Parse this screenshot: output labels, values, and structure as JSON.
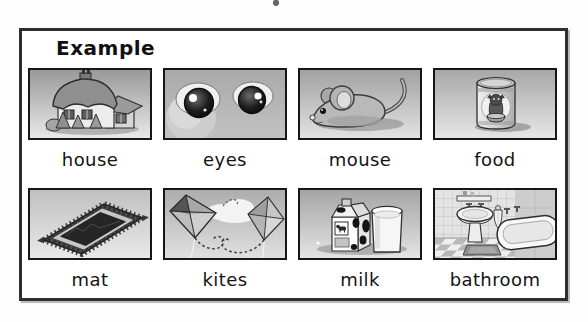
{
  "worksheet": {
    "title": "Example",
    "tiles": [
      {
        "label": "house",
        "image": "house-illustration"
      },
      {
        "label": "eyes",
        "image": "eyes-illustration"
      },
      {
        "label": "mouse",
        "image": "mouse-illustration"
      },
      {
        "label": "food",
        "image": "cat-food-can-illustration"
      },
      {
        "label": "mat",
        "image": "rug-illustration"
      },
      {
        "label": "kites",
        "image": "kites-illustration"
      },
      {
        "label": "milk",
        "image": "milk-carton-glass-illustration"
      },
      {
        "label": "bathroom",
        "image": "bathroom-illustration"
      }
    ],
    "colors": {
      "page_background": "#fdfdfd",
      "box_background": "#ffffff",
      "box_border": "#2e2e2e",
      "tile_border": "#161616",
      "label_text": "#141414",
      "illustration_style": "grayscale"
    }
  }
}
